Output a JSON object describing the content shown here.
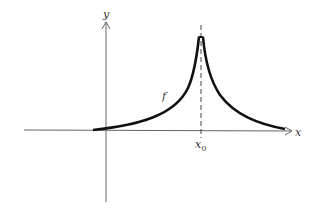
{
  "diagram": {
    "type": "function-graph",
    "axes": {
      "x_label": "x",
      "y_label": "y"
    },
    "curve_label": "f",
    "marker": {
      "label_base": "x",
      "label_sub": "0",
      "description": "vertical dashed asymptote-like line at x0 where f has a sharp peak (cusp)"
    },
    "colors": {
      "axis": "#666666",
      "curve": "#111111",
      "dashed": "#444444",
      "text": "#333333"
    }
  }
}
